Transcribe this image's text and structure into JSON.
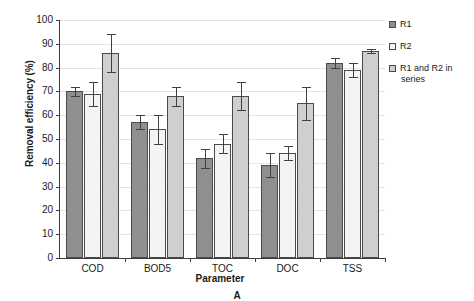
{
  "chart_data": {
    "type": "bar",
    "title": "",
    "caption": "A",
    "xlabel": "Parameter",
    "ylabel": "Removal efficiency (%)",
    "ylim": [
      0,
      100
    ],
    "ytick_labels": [
      "0",
      "10",
      "20",
      "30",
      "40",
      "50",
      "60",
      "70",
      "80",
      "90",
      "100"
    ],
    "ytick_values": [
      0,
      10,
      20,
      30,
      40,
      50,
      60,
      70,
      80,
      90,
      100
    ],
    "grid": "horizontal",
    "legend_position": "right",
    "categories": [
      "COD",
      "BOD5",
      "TOC",
      "DOC",
      "TSS"
    ],
    "series": [
      {
        "name": "R1",
        "color": "#8f8f8f",
        "values": [
          70,
          57,
          42,
          39,
          82
        ],
        "errors": [
          2,
          3,
          4,
          5,
          2
        ]
      },
      {
        "name": "R2",
        "color": "#f4f4f4",
        "values": [
          69,
          54,
          48,
          44,
          79
        ],
        "errors": [
          5,
          6,
          4,
          3,
          3
        ]
      },
      {
        "name": "R1 and R2 in series",
        "color": "#cfcfcf",
        "values": [
          86,
          68,
          68,
          65,
          87
        ],
        "errors": [
          8,
          4,
          6,
          7,
          1
        ]
      }
    ]
  },
  "legend": {
    "items": [
      {
        "label": "R1",
        "label_line2": ""
      },
      {
        "label": "R2",
        "label_line2": ""
      },
      {
        "label": "R1 and R2 in",
        "label_line2": "series"
      }
    ]
  },
  "colors": {
    "axis": "#3d3d3d",
    "grid": "#e4e4e4",
    "bar_r1": "#8f8f8f",
    "bar_r2": "#f4f4f4",
    "bar_series": "#cfcfcf",
    "bar_edge": "#4a4a4a",
    "background": "#ffffff"
  }
}
